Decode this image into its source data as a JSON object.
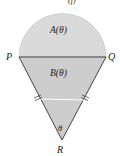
{
  "figure": {
    "type": "geometric-diagram",
    "labels": {
      "top_fragment": "(f)",
      "P": "P",
      "Q": "Q",
      "R": "R",
      "A": "A(θ)",
      "B": "B(θ)",
      "theta": "θ"
    },
    "colors": {
      "semicircle_fill": "#dadada",
      "triangle_fill": "#cdcdcd",
      "stroke": "#444444",
      "midline": "#ffffff"
    },
    "tick_marks": "double hash marks on sides PR and QR indicating equal length"
  }
}
